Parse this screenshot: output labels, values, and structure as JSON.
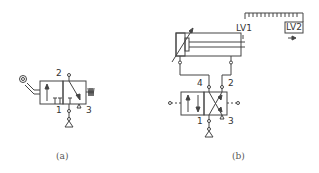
{
  "figure": {
    "diagram_a": {
      "caption": "(a)",
      "type": "3/2 roller-operated directional valve, spring return",
      "ports": {
        "p2": "2",
        "p1": "1",
        "p3": "3"
      }
    },
    "diagram_b": {
      "caption": "(b)",
      "type": "double-acting cylinder with adjustable cushioning controlled by 4/2 pilot-operated valve",
      "ports": {
        "p4": "4",
        "p2": "2",
        "p1": "1",
        "p3": "3"
      },
      "limit_valves": {
        "lv1": "LV1",
        "lv2": "LV2"
      }
    }
  },
  "colors": {
    "line": "#444444",
    "background": "#ffffff"
  }
}
